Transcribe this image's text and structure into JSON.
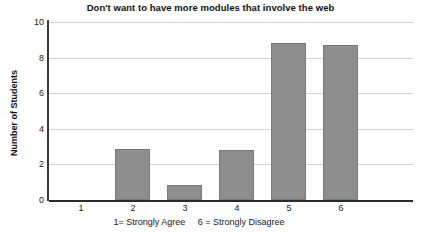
{
  "chart_data": {
    "type": "bar",
    "title": "Don't want to have more modules that involve the web",
    "xlabel": "",
    "ylabel": "Number of Students",
    "categories": [
      "1",
      "2",
      "3",
      "4",
      "5",
      "6"
    ],
    "values": [
      0,
      2.85,
      0.85,
      2.8,
      8.8,
      8.7
    ],
    "series": [
      {
        "name": "Number of Students",
        "values": [
          0,
          2.85,
          0.85,
          2.8,
          8.8,
          8.7
        ]
      }
    ],
    "ylim": [
      0,
      10
    ],
    "yticks": [
      0,
      2,
      4,
      6,
      8,
      10
    ],
    "ytick_labels": [
      "0",
      "2",
      "4",
      "6",
      "8",
      "10"
    ],
    "grid": true,
    "legend": false,
    "legend_position": "none",
    "bar_color": "#8e8e8e",
    "bar_edge_color": "#7a7a7a",
    "gridline_color": "#d2d2d2",
    "axis_color": "#2b2b2b",
    "annotations": [
      {
        "text": "1= Strongly Agree     6 = Strongly Disagree",
        "position": "below-x-axis"
      }
    ],
    "caption": "1= Strongly Agree     6 = Strongly Disagree"
  }
}
